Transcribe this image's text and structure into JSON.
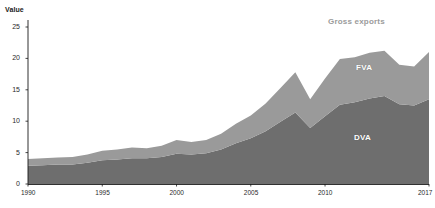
{
  "chart_data": {
    "type": "area",
    "stacked": true,
    "title": "",
    "subtitle": "",
    "xlabel": "",
    "ylabel": "Value",
    "ylim": [
      0,
      25
    ],
    "xlim": [
      1990,
      2017
    ],
    "grid": false,
    "legend_position": "inline-annotations",
    "y_ticks": [
      0,
      5,
      10,
      15,
      20,
      25
    ],
    "x_ticks": [
      1990,
      1995,
      2000,
      2005,
      2010,
      2017
    ],
    "x": [
      1990,
      1991,
      1992,
      1993,
      1994,
      1995,
      1996,
      1997,
      1998,
      1999,
      2000,
      2001,
      2002,
      2003,
      2004,
      2005,
      2006,
      2007,
      2008,
      2009,
      2010,
      2011,
      2012,
      2013,
      2014,
      2015,
      2016,
      2017
    ],
    "series": [
      {
        "name": "DVA",
        "label": "DVA",
        "color": "#6e6e6e",
        "order": 0,
        "values": [
          2.9,
          3.0,
          3.1,
          3.1,
          3.4,
          3.8,
          3.9,
          4.1,
          4.1,
          4.3,
          4.8,
          4.7,
          4.9,
          5.5,
          6.5,
          7.3,
          8.4,
          9.9,
          11.4,
          8.9,
          10.8,
          12.6,
          13.0,
          13.6,
          14.0,
          12.7,
          12.5,
          13.5
        ]
      },
      {
        "name": "FVA",
        "label": "FVA",
        "color": "#9a9a9a",
        "order": 1,
        "values": [
          1.1,
          1.1,
          1.1,
          1.2,
          1.3,
          1.5,
          1.6,
          1.7,
          1.6,
          1.8,
          2.2,
          2.0,
          2.1,
          2.5,
          3.1,
          3.6,
          4.4,
          5.4,
          6.4,
          4.6,
          6.0,
          7.3,
          7.2,
          7.3,
          7.2,
          6.3,
          6.2,
          7.5
        ]
      }
    ],
    "totals": {
      "name": "Gross exports",
      "label": "Gross exports",
      "color": "#9b9b9b",
      "values": [
        4.0,
        4.1,
        4.2,
        4.3,
        4.7,
        5.3,
        5.5,
        5.8,
        5.7,
        6.1,
        7.0,
        6.7,
        7.0,
        8.0,
        9.6,
        10.9,
        12.8,
        15.3,
        17.8,
        13.5,
        16.8,
        19.9,
        20.2,
        20.9,
        21.2,
        19.0,
        18.7,
        21.0
      ]
    },
    "annotations": [
      {
        "text": "Gross exports",
        "kind": "total-label"
      },
      {
        "text": "FVA",
        "kind": "series-label"
      },
      {
        "text": "DVA",
        "kind": "series-label"
      }
    ]
  },
  "axis": {
    "y_title": "Value",
    "y_tick_labels": [
      "25",
      "20",
      "15",
      "10",
      "5",
      "0"
    ],
    "x_tick_labels": [
      "1990",
      "1995",
      "2000",
      "2005",
      "2010",
      "2017"
    ]
  },
  "colors": {
    "dva": "#6e6e6e",
    "fva": "#9a9a9a",
    "axis": "#1a1a1a",
    "background": "#ffffff",
    "total_label": "#9b9b9b"
  }
}
